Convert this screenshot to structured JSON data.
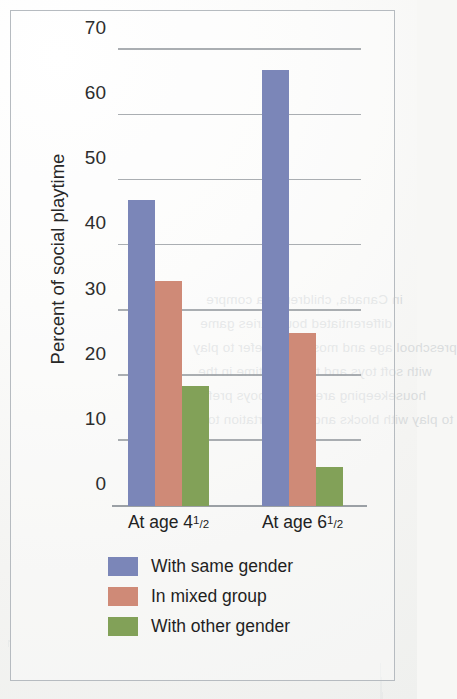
{
  "chart_data": {
    "type": "bar",
    "title": "",
    "xlabel": "",
    "ylabel": "Percent of social playtime",
    "categories": [
      "At age 4½",
      "At age 6½"
    ],
    "category_parts": [
      {
        "prefix": "At age 4",
        "num": "1",
        "den": "2"
      },
      {
        "prefix": "At age 6",
        "num": "1",
        "den": "2"
      }
    ],
    "series": [
      {
        "name": "With same gender",
        "color": "#7b86b8",
        "values": [
          47,
          67
        ]
      },
      {
        "name": "In mixed group",
        "color": "#cf8a77",
        "values": [
          34.5,
          26.5
        ]
      },
      {
        "name": "With other gender",
        "color": "#82a158",
        "values": [
          18.5,
          6
        ]
      }
    ],
    "ylim": [
      0,
      70
    ],
    "yticks": [
      0,
      10,
      20,
      30,
      40,
      50,
      60,
      70
    ],
    "ytick_labels": [
      "0",
      "10",
      "20",
      "30",
      "40",
      "50",
      "60",
      "70"
    ],
    "grid": true,
    "grid_color": "#9ba0a5",
    "legend_position": "bottom"
  },
  "ghost_text": [
    "in Canada, children; pia compre",
    "differentiated boundaries game",
    "preschool age and most girls prefer to play",
    "with soft toys and to spend time in the",
    "housekeeping area, most boys prefer",
    "to play with blocks and transportation toys."
  ]
}
